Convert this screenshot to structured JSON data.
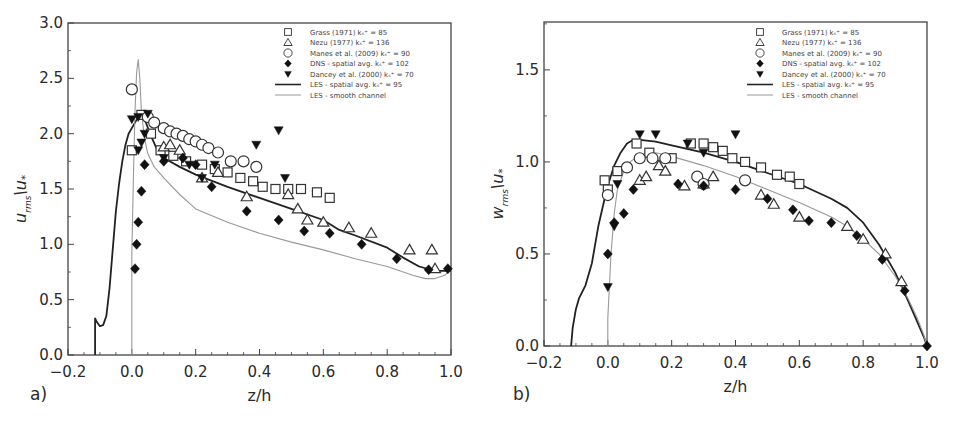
{
  "chart_data": [
    {
      "type": "scatter",
      "panel_label": "a)",
      "xlabel": "z/h",
      "ylabel_main": "u",
      "ylabel_sub": "rms",
      "ylabel_den": "\\u",
      "ylabel_den_sub": "*",
      "xlim": [
        -0.2,
        1.0
      ],
      "ylim": [
        0.0,
        3.0
      ],
      "xticks": [
        -0.2,
        0.0,
        0.2,
        0.4,
        0.6,
        0.8,
        1.0
      ],
      "xtick_labels": [
        "−0.2",
        "0.0",
        "0.2",
        "0.4",
        "0.6",
        "0.8",
        "1.0"
      ],
      "yticks": [
        0.0,
        0.5,
        1.0,
        1.5,
        2.0,
        2.5,
        3.0
      ],
      "ytick_labels": [
        "0.0",
        "0.5",
        "1.0",
        "1.5",
        "2.0",
        "2.5",
        "3.0"
      ],
      "grid": false,
      "legend_position": "top-right",
      "series": [
        {
          "name": "Grass (1971) k_s+ = 85",
          "marker": "square",
          "x": [
            0.0,
            0.03,
            0.06,
            0.09,
            0.13,
            0.17,
            0.22,
            0.26,
            0.3,
            0.34,
            0.38,
            0.41,
            0.45,
            0.49,
            0.53,
            0.58,
            0.62
          ],
          "y": [
            1.85,
            2.17,
            2.0,
            1.85,
            1.8,
            1.75,
            1.72,
            1.68,
            1.65,
            1.6,
            1.57,
            1.52,
            1.5,
            1.5,
            1.5,
            1.47,
            1.42
          ]
        },
        {
          "name": "Nezu (1977) k_s+ = 136",
          "marker": "triangle",
          "x": [
            0.1,
            0.12,
            0.15,
            0.22,
            0.27,
            0.36,
            0.49,
            0.52,
            0.55,
            0.6,
            0.68,
            0.75,
            0.87,
            0.94,
            0.95
          ],
          "y": [
            1.88,
            1.9,
            1.85,
            1.6,
            1.65,
            1.43,
            1.45,
            1.32,
            1.22,
            1.2,
            1.15,
            1.1,
            0.95,
            0.95,
            0.78
          ]
        },
        {
          "name": "Manes et al. (2009) k_s+ = 90",
          "marker": "circle",
          "x": [
            0.0,
            0.05,
            0.07,
            0.1,
            0.12,
            0.14,
            0.16,
            0.18,
            0.2,
            0.22,
            0.24,
            0.27,
            0.31,
            0.35,
            0.39
          ],
          "y": [
            2.4,
            2.15,
            2.1,
            2.05,
            2.02,
            2.0,
            1.98,
            1.95,
            1.93,
            1.9,
            1.87,
            1.83,
            1.75,
            1.75,
            1.7
          ]
        },
        {
          "name": "DNS - spatial avg. k_s+ = 102",
          "marker": "diamond",
          "x": [
            0.01,
            0.015,
            0.02,
            0.03,
            0.04,
            0.1,
            0.16,
            0.2,
            0.25,
            0.36,
            0.46,
            0.54,
            0.62,
            0.72,
            0.83,
            0.93,
            0.99
          ],
          "y": [
            0.78,
            1.0,
            1.2,
            1.48,
            1.72,
            1.75,
            1.78,
            1.72,
            1.52,
            1.3,
            1.22,
            1.12,
            1.1,
            1.0,
            0.87,
            0.77,
            0.78
          ]
        },
        {
          "name": "Dancey et al. (2000) k_s+ = 70",
          "marker": "inv-triangle",
          "x": [
            0.0,
            0.02,
            0.02,
            0.03,
            0.04,
            0.05,
            0.1,
            0.18,
            0.22,
            0.26,
            0.39,
            0.48,
            0.46
          ],
          "y": [
            2.13,
            1.85,
            2.15,
            1.92,
            2.0,
            2.18,
            1.78,
            1.72,
            1.6,
            1.72,
            1.9,
            1.6,
            2.03
          ]
        },
        {
          "name": "LES - spatial avg. k_s+ = 95",
          "marker": "line-dark",
          "x": [
            -0.115,
            -0.115,
            -0.11,
            -0.1,
            -0.09,
            -0.08,
            -0.07,
            -0.06,
            -0.05,
            -0.04,
            -0.03,
            -0.02,
            -0.01,
            0.0,
            0.01,
            0.02,
            0.03,
            0.04,
            0.06,
            0.08,
            0.1,
            0.15,
            0.2,
            0.3,
            0.4,
            0.5,
            0.6,
            0.65,
            0.7,
            0.8,
            0.85,
            0.9,
            0.95,
            1.0
          ],
          "y": [
            0.0,
            0.33,
            0.3,
            0.26,
            0.27,
            0.35,
            0.6,
            0.95,
            1.3,
            1.55,
            1.75,
            1.9,
            2.0,
            2.05,
            2.1,
            2.15,
            2.17,
            2.13,
            1.98,
            1.85,
            1.78,
            1.7,
            1.63,
            1.52,
            1.42,
            1.32,
            1.22,
            1.13,
            1.08,
            0.97,
            0.88,
            0.8,
            0.76,
            0.76
          ]
        },
        {
          "name": "LES - smooth channel",
          "marker": "line-light",
          "x": [
            0.0,
            0.0,
            0.005,
            0.01,
            0.015,
            0.02,
            0.025,
            0.03,
            0.04,
            0.05,
            0.07,
            0.1,
            0.15,
            0.2,
            0.3,
            0.4,
            0.5,
            0.6,
            0.7,
            0.8,
            0.88,
            0.92,
            0.95,
            0.98,
            1.0
          ],
          "y": [
            0.0,
            0.9,
            1.6,
            2.2,
            2.55,
            2.67,
            2.5,
            2.2,
            1.95,
            1.82,
            1.7,
            1.6,
            1.45,
            1.32,
            1.2,
            1.1,
            1.02,
            0.95,
            0.87,
            0.8,
            0.72,
            0.69,
            0.69,
            0.72,
            0.77
          ]
        }
      ]
    },
    {
      "type": "scatter",
      "panel_label": "b)",
      "xlabel": "z/h",
      "ylabel_main": "w",
      "ylabel_sub": "rms",
      "ylabel_den": "\\u",
      "ylabel_den_sub": "*",
      "xlim": [
        -0.2,
        1.0
      ],
      "ylim": [
        0.0,
        1.76
      ],
      "xticks": [
        -0.2,
        0.0,
        0.2,
        0.4,
        0.6,
        0.8,
        1.0
      ],
      "xtick_labels": [
        "−0.2",
        "0.0",
        "0.2",
        "0.4",
        "0.6",
        "0.8",
        "1.0"
      ],
      "yticks": [
        0.0,
        0.5,
        1.0,
        1.5
      ],
      "ytick_labels": [
        "0.0",
        "0.5",
        "1.0",
        "1.5"
      ],
      "grid": false,
      "legend_position": "top-right",
      "series": [
        {
          "name": "Grass (1971) k_s+ = 85",
          "marker": "square",
          "x": [
            -0.01,
            0.0,
            0.03,
            0.09,
            0.13,
            0.2,
            0.26,
            0.3,
            0.33,
            0.36,
            0.39,
            0.43,
            0.48,
            0.53,
            0.57,
            0.6
          ],
          "y": [
            0.9,
            0.85,
            0.95,
            1.1,
            1.05,
            1.02,
            1.1,
            1.1,
            1.08,
            1.06,
            1.02,
            1.0,
            0.97,
            0.93,
            0.92,
            0.88
          ]
        },
        {
          "name": "Nezu (1977) k_s+ = 136",
          "marker": "triangle",
          "x": [
            0.1,
            0.12,
            0.16,
            0.18,
            0.24,
            0.3,
            0.33,
            0.48,
            0.52,
            0.6,
            0.75,
            0.8,
            0.87,
            0.92
          ],
          "y": [
            0.9,
            0.92,
            0.98,
            0.95,
            0.87,
            0.88,
            0.92,
            0.82,
            0.77,
            0.7,
            0.65,
            0.58,
            0.5,
            0.35
          ]
        },
        {
          "name": "Manes et al. (2009) k_s+ = 90",
          "marker": "circle",
          "x": [
            0.0,
            0.06,
            0.1,
            0.14,
            0.18,
            0.28,
            0.3,
            0.43
          ],
          "y": [
            0.82,
            0.97,
            1.02,
            1.02,
            1.02,
            0.92,
            0.88,
            0.9
          ]
        },
        {
          "name": "DNS - spatial avg. k_s+ = 102",
          "marker": "diamond",
          "x": [
            0.0,
            0.02,
            0.05,
            0.08,
            0.22,
            0.3,
            0.4,
            0.5,
            0.58,
            0.63,
            0.7,
            0.78,
            0.86,
            0.93,
            1.0
          ],
          "y": [
            0.5,
            0.67,
            0.72,
            0.85,
            0.88,
            0.87,
            0.85,
            0.8,
            0.74,
            0.68,
            0.67,
            0.6,
            0.47,
            0.3,
            0.0
          ]
        },
        {
          "name": "Dancey et al. (2000) k_s+ = 70",
          "marker": "inv-triangle",
          "x": [
            0.0,
            0.02,
            0.03,
            0.1,
            0.15,
            0.25,
            0.3,
            0.4
          ],
          "y": [
            0.32,
            0.65,
            0.88,
            1.15,
            1.15,
            1.1,
            1.05,
            1.15
          ]
        },
        {
          "name": "LES - spatial avg. k_s+ = 95",
          "marker": "line-dark",
          "x": [
            -0.115,
            -0.11,
            -0.1,
            -0.09,
            -0.07,
            -0.05,
            -0.03,
            -0.01,
            0.0,
            0.02,
            0.04,
            0.06,
            0.08,
            0.1,
            0.15,
            0.2,
            0.3,
            0.4,
            0.5,
            0.6,
            0.7,
            0.75,
            0.8,
            0.85,
            0.9,
            0.94,
            0.97,
            0.99,
            1.0
          ],
          "y": [
            0.0,
            0.1,
            0.2,
            0.26,
            0.33,
            0.45,
            0.65,
            0.8,
            0.87,
            0.98,
            1.05,
            1.1,
            1.12,
            1.12,
            1.11,
            1.09,
            1.05,
            1.0,
            0.94,
            0.88,
            0.8,
            0.75,
            0.67,
            0.55,
            0.4,
            0.25,
            0.13,
            0.05,
            0.0
          ]
        },
        {
          "name": "LES - smooth channel",
          "marker": "line-light",
          "x": [
            0.0,
            0.0,
            0.01,
            0.02,
            0.03,
            0.05,
            0.07,
            0.1,
            0.15,
            0.2,
            0.3,
            0.4,
            0.5,
            0.6,
            0.7,
            0.75,
            0.8,
            0.85,
            0.9,
            0.94,
            0.97,
            0.99,
            1.0
          ],
          "y": [
            0.0,
            0.15,
            0.5,
            0.72,
            0.85,
            0.95,
            1.0,
            1.04,
            1.05,
            1.03,
            0.98,
            0.92,
            0.85,
            0.78,
            0.7,
            0.65,
            0.58,
            0.5,
            0.38,
            0.26,
            0.15,
            0.06,
            0.0
          ]
        }
      ]
    }
  ]
}
